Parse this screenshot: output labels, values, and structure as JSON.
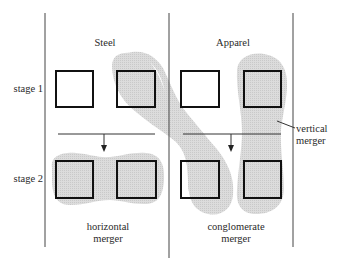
{
  "diagram": {
    "columns": [
      {
        "title": "Steel"
      },
      {
        "title": "Apparel"
      }
    ],
    "rows": [
      {
        "label": "stage 1"
      },
      {
        "label": "stage 2"
      }
    ],
    "merger_labels": {
      "horizontal": [
        "horizontal",
        "merger"
      ],
      "conglomerate": [
        "conglomerate",
        "merger"
      ],
      "vertical": [
        "vertical",
        "merger"
      ]
    },
    "colors": {
      "shade": "#d6d6d6",
      "line": "#333333",
      "box": "#111111",
      "background": "#ffffff"
    }
  }
}
